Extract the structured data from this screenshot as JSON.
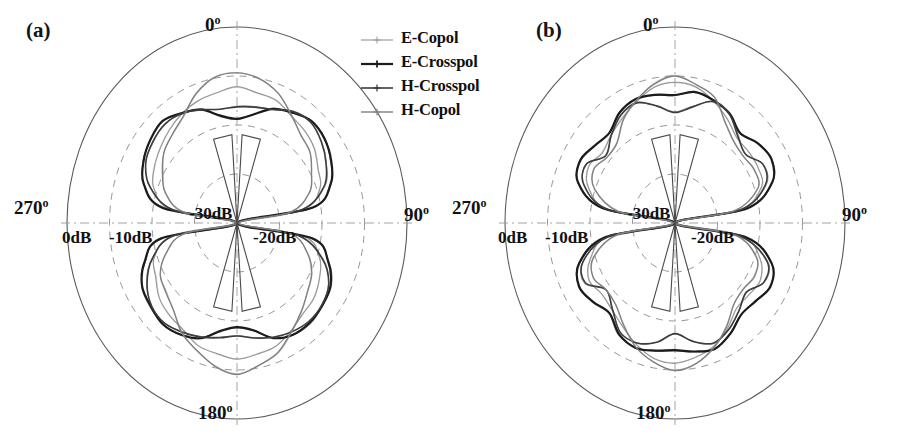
{
  "figure": {
    "panels": [
      {
        "tag": "(a)",
        "name": "panel-a",
        "center_x": 237,
        "center_y": 223,
        "radius_x": 170,
        "radius_y": 196,
        "angle_labels": [
          {
            "text": "0",
            "deg_sup": "o",
            "pos": "top"
          },
          {
            "text": "90",
            "deg_sup": "o",
            "pos": "right"
          },
          {
            "text": "180",
            "deg_sup": "o",
            "pos": "bottom"
          },
          {
            "text": "270",
            "deg_sup": "o",
            "pos": "left"
          }
        ],
        "ring_labels": [
          {
            "text": "0dB",
            "x": 62,
            "y": 228
          },
          {
            "text": "-10dB",
            "x": 109,
            "y": 228
          },
          {
            "text": "-30dB",
            "x": 189,
            "y": 204
          },
          {
            "text": "-20dB",
            "x": 253,
            "y": 228
          }
        ]
      },
      {
        "tag": "(b)",
        "name": "panel-b",
        "center_x": 675,
        "center_y": 223,
        "radius_x": 170,
        "radius_y": 196,
        "angle_labels": [
          {
            "text": "0",
            "deg_sup": "o",
            "pos": "top"
          },
          {
            "text": "90",
            "deg_sup": "o",
            "pos": "right"
          },
          {
            "text": "180",
            "deg_sup": "o",
            "pos": "bottom"
          },
          {
            "text": "270",
            "deg_sup": "o",
            "pos": "left"
          }
        ],
        "ring_labels": [
          {
            "text": "0dB",
            "x": 498,
            "y": 228
          },
          {
            "text": "-10dB",
            "x": 545,
            "y": 228
          },
          {
            "text": "-30dB",
            "x": 627,
            "y": 204
          },
          {
            "text": "-20dB",
            "x": 691,
            "y": 228
          }
        ]
      }
    ],
    "legend": {
      "items": [
        {
          "label": "E-Copol",
          "color": "#9a9a9a",
          "marker": "plus",
          "width": 1.2
        },
        {
          "label": "E-Crosspol",
          "color": "#1c1c1c",
          "marker": "plus",
          "width": 2.2
        },
        {
          "label": "H-Crosspol",
          "color": "#3d3d3d",
          "marker": "plus",
          "width": 1.6
        },
        {
          "label": "H-Copol",
          "color": "#808080",
          "marker": "plus",
          "width": 1.4
        }
      ]
    }
  },
  "chart_data": {
    "type": "line",
    "plot_kind": "polar-radiation-pattern",
    "title": "",
    "subtitle": "",
    "xlabel": "",
    "ylabel": "",
    "grid": true,
    "legend_position": "top-center",
    "angular_axis": {
      "unit": "degrees",
      "labels": [
        "0",
        "90",
        "180",
        "270"
      ],
      "tick_values": [
        0,
        90,
        180,
        270
      ],
      "zero_at": "top",
      "direction": "clockwise"
    },
    "radial_axis": {
      "unit": "dB",
      "tick_labels": [
        "0dB",
        "-10dB",
        "-20dB",
        "-30dB"
      ],
      "tick_values": [
        0,
        -10,
        -20,
        -30
      ],
      "rlim": [
        -40,
        0
      ],
      "outer_ring_value": 0,
      "center_value": -40,
      "ring_radii_fraction": [
        1.0,
        0.75,
        0.5,
        0.25
      ]
    },
    "panels": [
      {
        "tag": "(a)",
        "series": [
          {
            "name": "E-Copol",
            "color": "#9a9a9a",
            "theta_deg": [
              0,
              10,
              20,
              30,
              40,
              50,
              60,
              70,
              80,
              90,
              100,
              110,
              120,
              130,
              140,
              150,
              160,
              170,
              180,
              190,
              200,
              210,
              220,
              230,
              240,
              250,
              260,
              270,
              280,
              290,
              300,
              310,
              320,
              330,
              340,
              350
            ],
            "r_db": [
              -12.5,
              -12.8,
              -13.6,
              -14.6,
              -15.6,
              -16.5,
              -17.6,
              -19.2,
              -24.0,
              -40.0,
              -24.0,
              -19.2,
              -17.6,
              -16.5,
              -15.6,
              -14.6,
              -13.6,
              -12.8,
              -12.5,
              -12.8,
              -13.6,
              -14.6,
              -15.6,
              -16.5,
              -17.6,
              -19.2,
              -24.0,
              -40.0,
              -24.0,
              -19.2,
              -17.6,
              -16.5,
              -15.6,
              -14.6,
              -13.6,
              -12.8
            ]
          },
          {
            "name": "E-Crosspol",
            "color": "#1c1c1c",
            "theta_deg": [
              0,
              10,
              20,
              30,
              40,
              50,
              60,
              70,
              80,
              90,
              100,
              110,
              120,
              130,
              140,
              150,
              160,
              170,
              180,
              190,
              200,
              210,
              220,
              230,
              240,
              250,
              260,
              270,
              280,
              290,
              300,
              310,
              320,
              330,
              340,
              350
            ],
            "r_db": [
              -19.0,
              -17.4,
              -15.2,
              -13.7,
              -13.0,
              -13.4,
              -14.6,
              -16.8,
              -22.0,
              -40.0,
              -22.0,
              -16.8,
              -14.6,
              -13.4,
              -13.0,
              -13.7,
              -15.2,
              -17.4,
              -19.0,
              -17.4,
              -15.2,
              -13.7,
              -13.0,
              -13.4,
              -14.6,
              -16.8,
              -22.0,
              -40.0,
              -22.0,
              -16.8,
              -14.6,
              -13.4,
              -13.0,
              -13.7,
              -15.2,
              -17.4
            ]
          },
          {
            "name": "H-Crosspol",
            "color": "#3d3d3d",
            "theta_deg": [
              0,
              10,
              20,
              30,
              40,
              50,
              60,
              70,
              80,
              90,
              100,
              110,
              120,
              130,
              140,
              150,
              160,
              170,
              180,
              190,
              200,
              210,
              220,
              230,
              240,
              250,
              260,
              270,
              280,
              290,
              300,
              310,
              320,
              330,
              340,
              350
            ],
            "r_db": [
              -16.5,
              -16.0,
              -15.0,
              -14.0,
              -13.5,
              -14.0,
              -15.5,
              -18.5,
              -25.0,
              -40.0,
              -25.0,
              -18.5,
              -15.5,
              -14.0,
              -13.5,
              -14.0,
              -15.0,
              -16.0,
              -16.5,
              -16.0,
              -15.0,
              -14.0,
              -13.5,
              -14.0,
              -15.5,
              -18.5,
              -25.0,
              -40.0,
              -25.0,
              -18.5,
              -15.5,
              -14.0,
              -13.5,
              -14.0,
              -15.0,
              -16.0
            ]
          },
          {
            "name": "H-Copol",
            "color": "#808080",
            "theta_deg": [
              0,
              10,
              20,
              30,
              40,
              50,
              60,
              70,
              80,
              90,
              100,
              110,
              120,
              130,
              140,
              150,
              160,
              170,
              180,
              190,
              200,
              210,
              220,
              230,
              240,
              250,
              260,
              270,
              280,
              290,
              300,
              310,
              320,
              330,
              340,
              350
            ],
            "r_db": [
              -9.5,
              -10.2,
              -12.0,
              -14.5,
              -16.5,
              -18.0,
              -19.5,
              -22.0,
              -27.0,
              -40.0,
              -27.0,
              -22.0,
              -19.5,
              -18.0,
              -16.5,
              -14.5,
              -12.0,
              -10.2,
              -9.5,
              -10.2,
              -12.0,
              -14.5,
              -16.5,
              -18.0,
              -19.5,
              -22.0,
              -27.0,
              -40.0,
              -27.0,
              -22.0,
              -19.5,
              -18.0,
              -16.5,
              -14.5,
              -12.0,
              -10.2
            ]
          }
        ]
      },
      {
        "tag": "(b)",
        "series": [
          {
            "name": "E-Copol",
            "color": "#9a9a9a",
            "theta_deg": [
              0,
              10,
              20,
              30,
              40,
              50,
              60,
              70,
              80,
              90,
              100,
              110,
              120,
              130,
              140,
              150,
              160,
              170,
              180,
              190,
              200,
              210,
              220,
              230,
              240,
              250,
              260,
              270,
              280,
              290,
              300,
              310,
              320,
              330,
              340,
              350
            ],
            "r_db": [
              -11.5,
              -12.0,
              -13.5,
              -15.5,
              -17.0,
              -17.5,
              -17.0,
              -18.5,
              -24.0,
              -40.0,
              -24.0,
              -18.5,
              -17.0,
              -17.5,
              -17.0,
              -15.5,
              -13.5,
              -12.0,
              -11.5,
              -12.0,
              -13.5,
              -15.5,
              -17.0,
              -17.5,
              -17.0,
              -18.5,
              -24.0,
              -40.0,
              -24.0,
              -18.5,
              -17.0,
              -17.5,
              -17.0,
              -15.5,
              -13.5,
              -12.0
            ]
          },
          {
            "name": "E-Crosspol",
            "color": "#1c1c1c",
            "theta_deg": [
              0,
              10,
              20,
              30,
              40,
              50,
              60,
              70,
              80,
              90,
              100,
              110,
              120,
              130,
              140,
              150,
              160,
              170,
              180,
              190,
              200,
              210,
              220,
              230,
              240,
              250,
              260,
              270,
              280,
              290,
              300,
              310,
              320,
              330,
              340,
              350
            ],
            "r_db": [
              -14.0,
              -13.2,
              -13.0,
              -14.0,
              -16.0,
              -15.0,
              -14.0,
              -16.0,
              -23.0,
              -40.0,
              -23.0,
              -16.0,
              -14.0,
              -15.0,
              -16.0,
              -14.0,
              -13.0,
              -13.2,
              -14.0,
              -13.2,
              -13.0,
              -14.0,
              -16.0,
              -15.0,
              -14.0,
              -16.0,
              -23.0,
              -40.0,
              -23.0,
              -16.0,
              -14.0,
              -15.0,
              -16.0,
              -14.0,
              -13.0,
              -13.2
            ]
          },
          {
            "name": "H-Crosspol",
            "color": "#3d3d3d",
            "theta_deg": [
              0,
              10,
              20,
              30,
              40,
              50,
              60,
              70,
              80,
              90,
              100,
              110,
              120,
              130,
              140,
              150,
              160,
              170,
              180,
              190,
              200,
              210,
              220,
              230,
              240,
              250,
              260,
              270,
              280,
              290,
              300,
              310,
              320,
              330,
              340,
              350
            ],
            "r_db": [
              -17.5,
              -15.5,
              -13.8,
              -14.5,
              -17.0,
              -18.5,
              -16.0,
              -17.0,
              -24.0,
              -40.0,
              -24.0,
              -17.0,
              -16.0,
              -18.5,
              -17.0,
              -14.5,
              -13.8,
              -15.5,
              -17.5,
              -15.5,
              -13.8,
              -14.5,
              -17.0,
              -18.5,
              -16.0,
              -17.0,
              -24.0,
              -40.0,
              -24.0,
              -17.0,
              -16.0,
              -18.5,
              -17.0,
              -14.5,
              -13.8,
              -15.5
            ]
          },
          {
            "name": "H-Copol",
            "color": "#808080",
            "theta_deg": [
              0,
              10,
              20,
              30,
              40,
              50,
              60,
              70,
              80,
              90,
              100,
              110,
              120,
              130,
              140,
              150,
              160,
              170,
              180,
              190,
              200,
              210,
              220,
              230,
              240,
              250,
              260,
              270,
              280,
              290,
              300,
              310,
              320,
              330,
              340,
              350
            ],
            "r_db": [
              -10.0,
              -11.0,
              -13.0,
              -16.0,
              -18.5,
              -19.0,
              -18.0,
              -19.5,
              -26.0,
              -40.0,
              -26.0,
              -19.5,
              -18.0,
              -19.0,
              -18.5,
              -16.0,
              -13.0,
              -11.0,
              -10.0,
              -11.0,
              -13.0,
              -16.0,
              -18.5,
              -19.0,
              -18.0,
              -19.5,
              -26.0,
              -40.0,
              -26.0,
              -19.5,
              -18.0,
              -19.0,
              -18.5,
              -16.0,
              -13.0,
              -11.0
            ]
          }
        ]
      }
    ]
  }
}
